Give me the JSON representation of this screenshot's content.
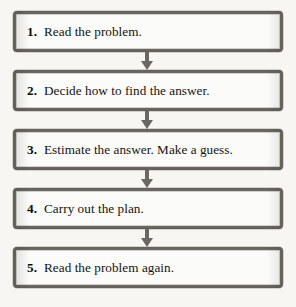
{
  "figure": {
    "type": "flowchart",
    "orientation": "vertical",
    "colors": {
      "page_background": "#f7f6f3",
      "box_fill": "#fbfbf9",
      "box_border": "#6f6c66",
      "text": "#15130f",
      "arrow": "#6b6862"
    },
    "steps": [
      {
        "number": "1.",
        "label": "Read the problem."
      },
      {
        "number": "2.",
        "label": "Decide how to find the answer."
      },
      {
        "number": "3.",
        "label": "Estimate the answer. Make a guess."
      },
      {
        "number": "4.",
        "label": "Carry out the plan."
      },
      {
        "number": "5.",
        "label": "Read the problem again."
      }
    ],
    "connectors": [
      {
        "from": "1",
        "to": "2",
        "icon": "arrow-down-icon"
      },
      {
        "from": "2",
        "to": "3",
        "icon": "arrow-down-icon"
      },
      {
        "from": "3",
        "to": "4",
        "icon": "arrow-down-icon"
      },
      {
        "from": "4",
        "to": "5",
        "icon": "arrow-down-icon"
      }
    ]
  }
}
